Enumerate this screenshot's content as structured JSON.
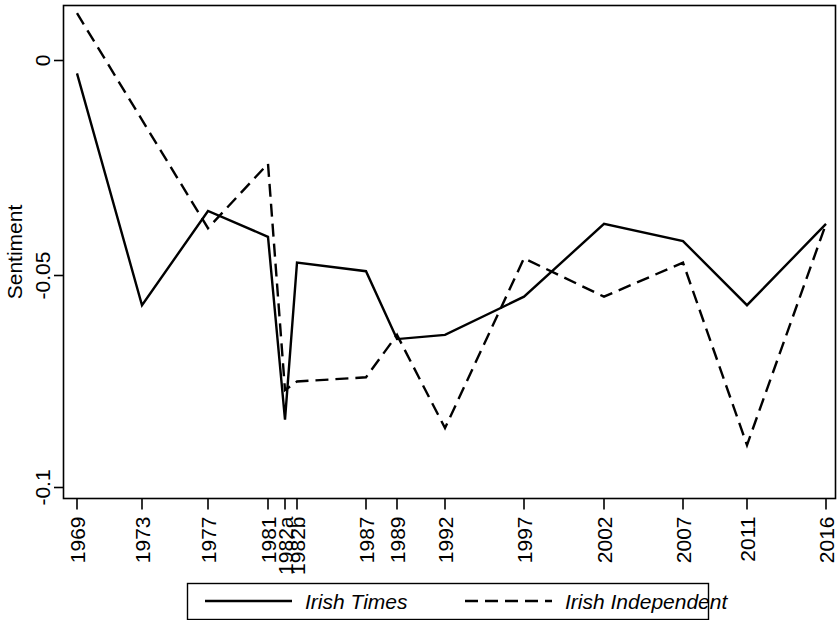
{
  "chart_data": {
    "type": "line",
    "title": "",
    "xlabel": "",
    "ylabel": "Sentiment",
    "categories": [
      "1969",
      "1973",
      "1977",
      "1981",
      "1982a",
      "1982b",
      "1987",
      "1989",
      "1992",
      "1997",
      "2002",
      "2007",
      "2011",
      "2016"
    ],
    "series": [
      {
        "name": "Irish Times",
        "style": "solid",
        "color": "#000000",
        "values": [
          -0.003,
          -0.057,
          -0.035,
          -0.041,
          -0.084,
          -0.047,
          -0.049,
          -0.065,
          -0.064,
          -0.055,
          -0.038,
          -0.042,
          -0.057,
          -0.038
        ]
      },
      {
        "name": "Irish Independent",
        "style": "dashed",
        "color": "#000000",
        "values": [
          0.011,
          null,
          -0.039,
          -0.024,
          -0.077,
          -0.075,
          -0.074,
          -0.064,
          -0.086,
          -0.046,
          -0.055,
          -0.047,
          -0.09,
          -0.038
        ]
      }
    ],
    "ylim": [
      -0.107,
      0.0155
    ],
    "yticks": [
      0,
      -0.05,
      -0.1
    ],
    "ytick_labels": [
      "0",
      "-0.05",
      "-0.1"
    ],
    "grid": false,
    "legend_position": "bottom",
    "legend": [
      {
        "label": "Irish Times",
        "style": "solid"
      },
      {
        "label": "Irish Independent",
        "style": "dashed"
      }
    ]
  }
}
